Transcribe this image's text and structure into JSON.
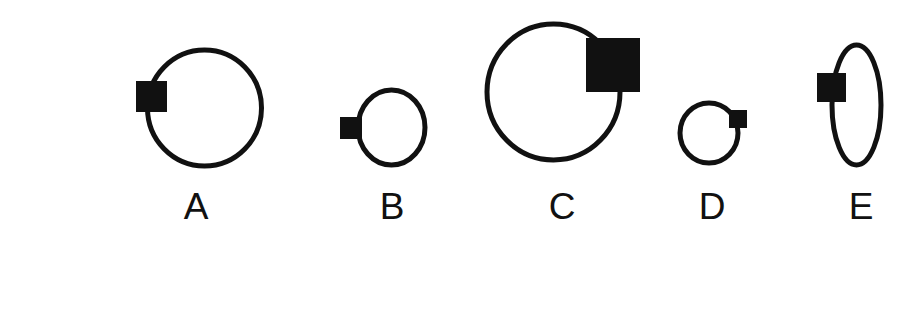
{
  "page": {
    "background_color": "#ffffff",
    "width": 903,
    "height": 332,
    "ink_color": "#111111",
    "box_border_color": "#6f6f6f"
  },
  "figures": [
    {
      "id": "A",
      "label": "A",
      "label_x": 196,
      "shape": "circle",
      "circle": {
        "cx": 204.5,
        "cy": 108,
        "rx": 57,
        "ry": 58,
        "stroke_width": 5
      },
      "square": {
        "x": 136,
        "y": 81,
        "size": 31,
        "position": "left"
      }
    },
    {
      "id": "B",
      "label": "B",
      "label_x": 392,
      "shape": "circle",
      "circle": {
        "cx": 391.5,
        "cy": 127.5,
        "rx": 33.5,
        "ry": 37.5,
        "stroke_width": 5
      },
      "square": {
        "x": 340,
        "y": 117,
        "size": 22,
        "position": "left"
      }
    },
    {
      "id": "C",
      "label": "C",
      "label_x": 562,
      "shape": "circle",
      "circle": {
        "cx": 553.5,
        "cy": 92,
        "rx": 66.5,
        "ry": 68,
        "stroke_width": 5
      },
      "square": {
        "x": 586,
        "y": 38,
        "size": 54,
        "position": "right"
      }
    },
    {
      "id": "D",
      "label": "D",
      "label_x": 712,
      "shape": "circle",
      "circle": {
        "cx": 709,
        "cy": 133,
        "rx": 29,
        "ry": 30,
        "stroke_width": 5
      },
      "square": {
        "x": 729,
        "y": 110,
        "size": 18,
        "position": "right"
      }
    },
    {
      "id": "E",
      "label": "E",
      "label_x": 861,
      "shape": "ellipse",
      "circle": {
        "cx": 856.5,
        "cy": 105,
        "rx": 24.5,
        "ry": 60,
        "stroke_width": 5
      },
      "square": {
        "x": 817,
        "y": 73,
        "size": 29,
        "position": "left"
      }
    }
  ],
  "answer": {
    "label": "Answer",
    "box": {
      "x": 128,
      "y": 281,
      "width": 256,
      "height": 70
    },
    "value": ""
  }
}
